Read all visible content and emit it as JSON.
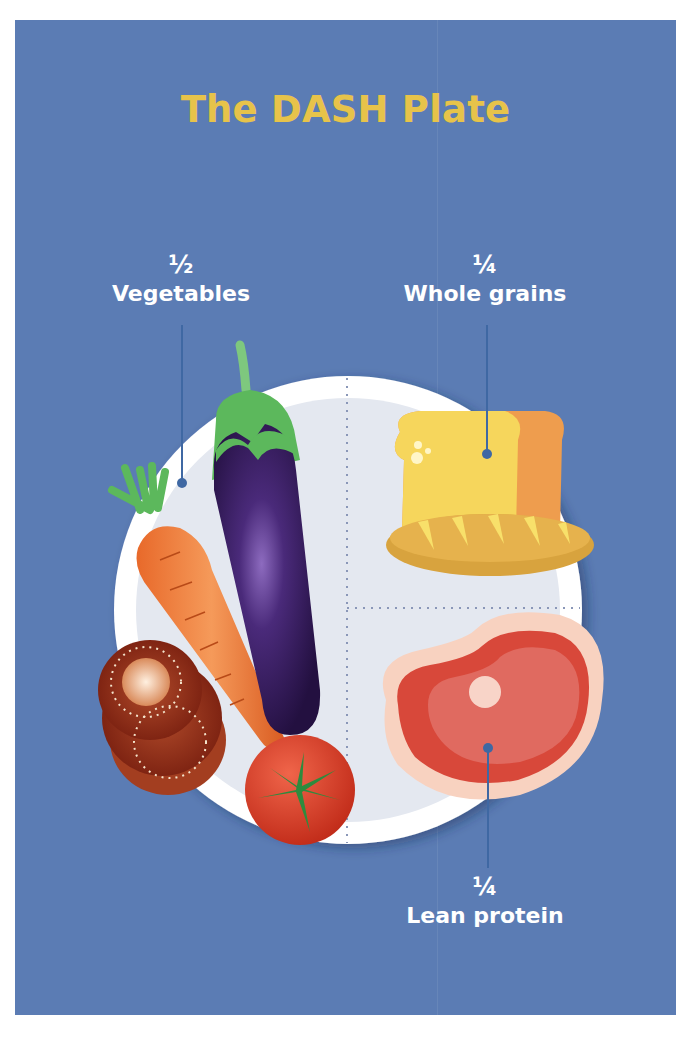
{
  "title": "The DASH Plate",
  "colors": {
    "background_panel": "#5b7cb4",
    "title": "#e7c34a",
    "label_text": "#ffffff",
    "plate_rim": "#ffffff",
    "plate_center": "#e4e8f0",
    "leader_line": "#3f68a3"
  },
  "sections": [
    {
      "fraction": "½",
      "label": "Vegetables",
      "foods": [
        "eggplant",
        "carrot",
        "tomato",
        "tomato slices"
      ]
    },
    {
      "fraction": "¼",
      "label": "Whole grains",
      "foods": [
        "bread loaf",
        "baguette"
      ]
    },
    {
      "fraction": "¼",
      "label": "Lean protein",
      "foods": [
        "steak"
      ]
    }
  ]
}
